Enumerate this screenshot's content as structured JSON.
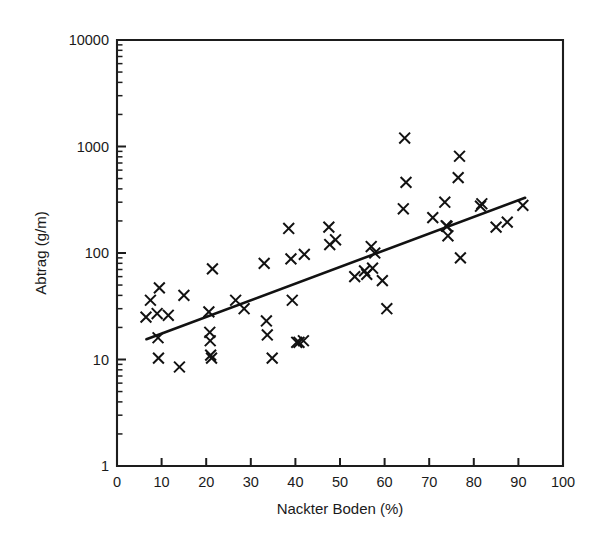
{
  "chart_data": {
    "type": "scatter",
    "title": "",
    "subtitle": "",
    "xlabel": "Nackter Boden (%)",
    "ylabel": "Abtrag (g/m)",
    "xlim": [
      0,
      100
    ],
    "ylim": [
      1,
      10000
    ],
    "yscale": "log",
    "xscale": "linear",
    "grid": false,
    "legend": null,
    "x_ticks": [
      0,
      10,
      20,
      30,
      40,
      50,
      60,
      70,
      80,
      90,
      100
    ],
    "x_tick_labels": [
      "0",
      "10",
      "20",
      "30",
      "40",
      "50",
      "60",
      "70",
      "80",
      "90",
      "100"
    ],
    "y_ticks": [
      1,
      10,
      100,
      1000,
      10000
    ],
    "y_tick_labels": [
      "1",
      "10",
      "100",
      "1000",
      "10000"
    ],
    "y_minor_ticks_per_decade": 8,
    "marker_symbol": "x",
    "marker_color": "#121212",
    "line_color": "#121212",
    "points": [
      {
        "x": 6.5,
        "y": 25
      },
      {
        "x": 7.5,
        "y": 36
      },
      {
        "x": 9.0,
        "y": 27
      },
      {
        "x": 9.5,
        "y": 47
      },
      {
        "x": 9.2,
        "y": 16
      },
      {
        "x": 9.3,
        "y": 10.3
      },
      {
        "x": 11.5,
        "y": 26
      },
      {
        "x": 14.0,
        "y": 8.5
      },
      {
        "x": 15.0,
        "y": 40
      },
      {
        "x": 20.6,
        "y": 28
      },
      {
        "x": 20.8,
        "y": 18
      },
      {
        "x": 20.9,
        "y": 15
      },
      {
        "x": 21.0,
        "y": 11
      },
      {
        "x": 21.2,
        "y": 10.3
      },
      {
        "x": 21.4,
        "y": 71
      },
      {
        "x": 26.6,
        "y": 36
      },
      {
        "x": 28.5,
        "y": 30
      },
      {
        "x": 33.0,
        "y": 80
      },
      {
        "x": 33.5,
        "y": 23
      },
      {
        "x": 33.7,
        "y": 17
      },
      {
        "x": 34.8,
        "y": 10.3
      },
      {
        "x": 38.5,
        "y": 170
      },
      {
        "x": 39.0,
        "y": 88
      },
      {
        "x": 39.3,
        "y": 36
      },
      {
        "x": 40.3,
        "y": 14.5
      },
      {
        "x": 40.8,
        "y": 14.5
      },
      {
        "x": 41.8,
        "y": 15
      },
      {
        "x": 42.0,
        "y": 97
      },
      {
        "x": 47.5,
        "y": 175
      },
      {
        "x": 47.7,
        "y": 120
      },
      {
        "x": 49.0,
        "y": 133
      },
      {
        "x": 53.3,
        "y": 60
      },
      {
        "x": 55.5,
        "y": 68
      },
      {
        "x": 56.0,
        "y": 63
      },
      {
        "x": 57.0,
        "y": 115
      },
      {
        "x": 57.3,
        "y": 72
      },
      {
        "x": 57.8,
        "y": 100
      },
      {
        "x": 59.5,
        "y": 55
      },
      {
        "x": 60.5,
        "y": 30
      },
      {
        "x": 64.5,
        "y": 1200
      },
      {
        "x": 64.8,
        "y": 460
      },
      {
        "x": 64.2,
        "y": 260
      },
      {
        "x": 70.8,
        "y": 215
      },
      {
        "x": 73.5,
        "y": 300
      },
      {
        "x": 73.8,
        "y": 180
      },
      {
        "x": 74.0,
        "y": 178
      },
      {
        "x": 74.2,
        "y": 145
      },
      {
        "x": 76.8,
        "y": 810
      },
      {
        "x": 76.5,
        "y": 510
      },
      {
        "x": 77.0,
        "y": 90
      },
      {
        "x": 81.5,
        "y": 275
      },
      {
        "x": 81.8,
        "y": 290
      },
      {
        "x": 85.0,
        "y": 175
      },
      {
        "x": 87.5,
        "y": 195
      },
      {
        "x": 91.0,
        "y": 280
      }
    ],
    "fit_line": {
      "label": "regression",
      "x_start": 6.6,
      "y_start": 15.5,
      "x_end": 91.5,
      "y_end": 330
    },
    "annotations": []
  }
}
